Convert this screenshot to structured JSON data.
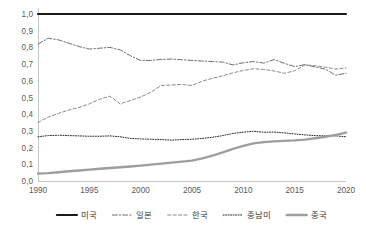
{
  "chart_data": {
    "type": "line",
    "title": "",
    "subtitle": "",
    "xlabel": "",
    "ylabel": "",
    "xlim": [
      1990,
      2020
    ],
    "ylim": [
      0.0,
      1.0
    ],
    "grid": false,
    "legend_position": "bottom",
    "decimal_separator": ",",
    "background_color": "#ffffff",
    "x": [
      1990,
      1991,
      1992,
      1993,
      1994,
      1995,
      1996,
      1997,
      1998,
      1999,
      2000,
      2001,
      2002,
      2003,
      2004,
      2005,
      2006,
      2007,
      2008,
      2009,
      2010,
      2011,
      2012,
      2013,
      2014,
      2015,
      2016,
      2017,
      2018,
      2019,
      2020
    ],
    "xticks": [
      1990,
      1995,
      2000,
      2005,
      2010,
      2015,
      2020
    ],
    "xtick_labels": [
      "1990",
      "1995",
      "2000",
      "2005",
      "2010",
      "2015",
      "2020"
    ],
    "yticks": [
      0.0,
      0.1,
      0.2,
      0.3,
      0.4,
      0.5,
      0.6,
      0.7,
      0.8,
      0.9,
      1.0
    ],
    "ytick_labels": [
      "0,0",
      "0,1",
      "0,2",
      "0,3",
      "0,4",
      "0,5",
      "0,6",
      "0,7",
      "0,8",
      "0,9",
      "1,0"
    ],
    "series": [
      {
        "name": "미국",
        "color": "#1a1a1a",
        "width": 2.2,
        "dash": "none",
        "legend_dash": "none",
        "values": [
          1.0,
          1.0,
          1.0,
          1.0,
          1.0,
          1.0,
          1.0,
          1.0,
          1.0,
          1.0,
          1.0,
          1.0,
          1.0,
          1.0,
          1.0,
          1.0,
          1.0,
          1.0,
          1.0,
          1.0,
          1.0,
          1.0,
          1.0,
          1.0,
          1.0,
          1.0,
          1.0,
          1.0,
          1.0,
          1.0,
          1.0
        ]
      },
      {
        "name": "일본",
        "color": "#6e6e6e",
        "width": 1.0,
        "dash": "5,2,1.4,2",
        "legend_dash": "5,2,1.4,2",
        "values": [
          0.82,
          0.855,
          0.845,
          0.825,
          0.805,
          0.79,
          0.795,
          0.8,
          0.785,
          0.75,
          0.722,
          0.722,
          0.728,
          0.73,
          0.726,
          0.722,
          0.718,
          0.715,
          0.712,
          0.695,
          0.708,
          0.715,
          0.706,
          0.727,
          0.705,
          0.685,
          0.697,
          0.683,
          0.67,
          0.633,
          0.645
        ]
      },
      {
        "name": "한국",
        "color": "#8a8a8a",
        "width": 1.0,
        "dash": "3.2,2.2",
        "legend_dash": "3.2,2.2",
        "values": [
          0.35,
          0.383,
          0.405,
          0.425,
          0.44,
          0.462,
          0.49,
          0.508,
          0.462,
          0.482,
          0.503,
          0.532,
          0.572,
          0.575,
          0.578,
          0.572,
          0.598,
          0.615,
          0.63,
          0.648,
          0.662,
          0.672,
          0.668,
          0.659,
          0.645,
          0.66,
          0.695,
          0.69,
          0.682,
          0.67,
          0.677
        ]
      },
      {
        "name": "중남미",
        "color": "#2b2b2b",
        "width": 1.0,
        "dash": "1,1.5",
        "legend_dash": "1,1.5",
        "values": [
          0.265,
          0.272,
          0.274,
          0.272,
          0.27,
          0.268,
          0.268,
          0.27,
          0.265,
          0.255,
          0.252,
          0.25,
          0.248,
          0.245,
          0.248,
          0.25,
          0.255,
          0.262,
          0.272,
          0.285,
          0.292,
          0.298,
          0.292,
          0.293,
          0.288,
          0.282,
          0.276,
          0.272,
          0.27,
          0.27,
          0.265
        ]
      },
      {
        "name": "중국",
        "color": "#9e9e9e",
        "width": 2.4,
        "dash": "none",
        "legend_dash": "none",
        "values": [
          0.045,
          0.047,
          0.052,
          0.058,
          0.063,
          0.068,
          0.073,
          0.078,
          0.082,
          0.087,
          0.092,
          0.098,
          0.104,
          0.11,
          0.116,
          0.122,
          0.135,
          0.152,
          0.172,
          0.192,
          0.21,
          0.225,
          0.233,
          0.237,
          0.24,
          0.243,
          0.248,
          0.256,
          0.265,
          0.276,
          0.29
        ]
      }
    ]
  },
  "legend": {
    "items": [
      {
        "label": "미국"
      },
      {
        "label": "일본"
      },
      {
        "label": "한국"
      },
      {
        "label": "중남미"
      },
      {
        "label": "중국"
      }
    ]
  }
}
